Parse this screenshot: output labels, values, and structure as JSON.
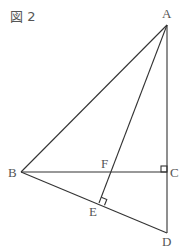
{
  "figure": {
    "title": "図 2",
    "points": {
      "A": {
        "label": "A",
        "x": 167,
        "y": 25,
        "lx": 162,
        "ly": 18
      },
      "B": {
        "label": "B",
        "x": 21,
        "y": 172,
        "lx": 8,
        "ly": 177
      },
      "C": {
        "label": "C",
        "x": 167,
        "y": 172,
        "lx": 170,
        "ly": 177
      },
      "D": {
        "label": "D",
        "x": 167,
        "y": 233,
        "lx": 162,
        "ly": 247
      },
      "E": {
        "label": "E",
        "x": 99,
        "y": 203,
        "lx": 89,
        "ly": 216
      },
      "F": {
        "label": "F",
        "x": 110,
        "y": 172,
        "lx": 101,
        "ly": 168
      }
    },
    "segments": [
      "AB",
      "AC",
      "CD",
      "BC",
      "BD",
      "AE"
    ],
    "right_angles": [
      "C (ACB)",
      "E (AEB)"
    ],
    "colors": {
      "line": "#333333",
      "label": "#555555"
    }
  }
}
